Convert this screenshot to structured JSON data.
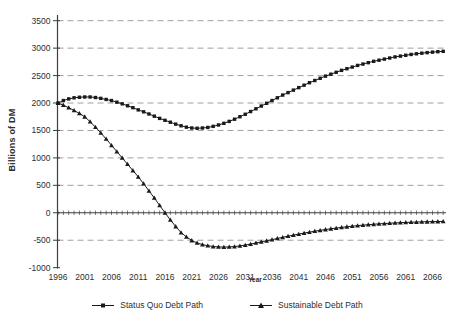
{
  "figure": {
    "background": "#ffffff",
    "axis_color": "#3d3d3d",
    "gridline_color": "#a0a0a0",
    "series_color": "#1a1a1a",
    "text_color": "#2e2e2e"
  },
  "chart_data": {
    "type": "line",
    "title": "",
    "xlabel": "Year",
    "ylabel": "Billions of DM",
    "years": {
      "start": 1996,
      "end": 2068,
      "interval": 1
    },
    "x_tick_labels": [
      "1996",
      "2001",
      "2006",
      "2011",
      "2016",
      "2021",
      "2026",
      "2031",
      "2036",
      "2041",
      "2046",
      "2051",
      "2056",
      "2061",
      "2066"
    ],
    "y_ticks": [
      3500,
      3000,
      2500,
      2000,
      1500,
      1000,
      500,
      0,
      -500,
      -1000
    ],
    "ylim": [
      -1000,
      3500
    ],
    "grid": "horizontal-dashed",
    "legend_position": "bottom",
    "series": [
      {
        "name": "Status Quo Debt Path",
        "marker": "square",
        "values": [
          2000,
          2045,
          2075,
          2095,
          2105,
          2110,
          2110,
          2100,
          2085,
          2065,
          2045,
          2015,
          1985,
          1950,
          1915,
          1875,
          1840,
          1800,
          1760,
          1720,
          1685,
          1650,
          1615,
          1585,
          1560,
          1545,
          1540,
          1545,
          1555,
          1575,
          1600,
          1630,
          1665,
          1705,
          1750,
          1795,
          1845,
          1895,
          1945,
          1995,
          2045,
          2095,
          2145,
          2190,
          2235,
          2280,
          2325,
          2370,
          2410,
          2450,
          2490,
          2525,
          2560,
          2595,
          2625,
          2655,
          2685,
          2710,
          2735,
          2760,
          2780,
          2800,
          2820,
          2840,
          2855,
          2870,
          2885,
          2897,
          2908,
          2918,
          2927,
          2935,
          2942
        ]
      },
      {
        "name": "Sustainable Debt Path",
        "marker": "triangle",
        "values": [
          2000,
          1960,
          1915,
          1865,
          1810,
          1750,
          1660,
          1560,
          1455,
          1345,
          1230,
          1115,
          1000,
          885,
          770,
          655,
          530,
          400,
          270,
          135,
          0,
          -130,
          -250,
          -360,
          -440,
          -505,
          -550,
          -580,
          -600,
          -615,
          -622,
          -625,
          -622,
          -615,
          -603,
          -588,
          -570,
          -550,
          -530,
          -510,
          -490,
          -468,
          -447,
          -427,
          -407,
          -388,
          -370,
          -353,
          -336,
          -320,
          -305,
          -291,
          -278,
          -266,
          -255,
          -244,
          -234,
          -225,
          -217,
          -209,
          -202,
          -196,
          -190,
          -185,
          -180,
          -176,
          -172,
          -169,
          -166,
          -163,
          -161,
          -159,
          -157
        ]
      }
    ]
  }
}
